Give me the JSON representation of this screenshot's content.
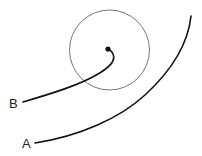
{
  "diagram": {
    "labels": {
      "a": "A",
      "b": "B"
    },
    "colors": {
      "stroke": "#111111",
      "circle": "#666666",
      "background": "#ffffff"
    },
    "circle": {
      "cx": 109.5,
      "cy": 50,
      "r": 40
    },
    "point": {
      "cx": 108,
      "cy": 49,
      "r": 2.6
    }
  }
}
